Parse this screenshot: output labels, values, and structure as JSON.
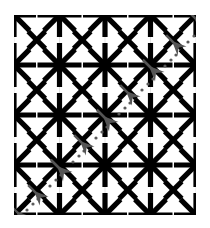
{
  "figure": {
    "type": "optical-illusion-pattern",
    "canvas": {
      "width": 210,
      "height": 228
    },
    "background_color": "#ffffff"
  },
  "lattice": {
    "description": "5 by 5 grid of 8-armed black asterisk nodes with black X marks at the centers of the cells between them",
    "node_rows": 5,
    "node_cols": 5,
    "origin_x": 14,
    "origin_y": 15,
    "step_x": 45.5,
    "step_y": 50.0,
    "node_arm_length": 22,
    "node_stroke_width": 5.2,
    "node_color": "#000000",
    "cross_arm_length": 12,
    "cross_stroke_width": 5.2,
    "cross_color": "#000000",
    "gridline_color": "#dcdcdc",
    "gridline_width": 0.8,
    "clip_box": {
      "x": 14,
      "y": 15,
      "width": 182,
      "height": 200
    }
  },
  "arrow_chain": {
    "description": "Chain of gray arrowheads with dotted trails running along the anti-diagonal from the top-right corner to the bottom-left corner",
    "color": "#555555",
    "dot_color": "#5a5a5a",
    "direction_degrees": 225,
    "arrowhead_size": 15,
    "start": {
      "x": 197,
      "y": 14
    },
    "end": {
      "x": 16,
      "y": 212
    },
    "arrowheads": [
      {
        "x": 194,
        "y": 17,
        "size": 16
      },
      {
        "x": 172,
        "y": 41,
        "size": 15
      },
      {
        "x": 149,
        "y": 66,
        "size": 16
      },
      {
        "x": 126,
        "y": 91,
        "size": 15
      },
      {
        "x": 103,
        "y": 116,
        "size": 16
      },
      {
        "x": 80,
        "y": 141,
        "size": 15
      },
      {
        "x": 57,
        "y": 166,
        "size": 16
      },
      {
        "x": 34,
        "y": 191,
        "size": 15
      },
      {
        "x": 16,
        "y": 211,
        "size": 14
      }
    ],
    "dot_trail": {
      "dot_radius": 1.6,
      "offset_perpendicular": 11,
      "dots": [
        {
          "x": 199,
          "y": 31
        },
        {
          "x": 194,
          "y": 36
        },
        {
          "x": 188,
          "y": 42
        },
        {
          "x": 176,
          "y": 55
        },
        {
          "x": 171,
          "y": 60
        },
        {
          "x": 165,
          "y": 66
        },
        {
          "x": 153,
          "y": 79
        },
        {
          "x": 148,
          "y": 84
        },
        {
          "x": 142,
          "y": 90
        },
        {
          "x": 130,
          "y": 103
        },
        {
          "x": 125,
          "y": 108
        },
        {
          "x": 119,
          "y": 114
        },
        {
          "x": 107,
          "y": 127
        },
        {
          "x": 102,
          "y": 132
        },
        {
          "x": 96,
          "y": 138
        },
        {
          "x": 84,
          "y": 151
        },
        {
          "x": 79,
          "y": 156
        },
        {
          "x": 73,
          "y": 162
        },
        {
          "x": 61,
          "y": 175
        },
        {
          "x": 56,
          "y": 180
        },
        {
          "x": 50,
          "y": 186
        },
        {
          "x": 38,
          "y": 199
        },
        {
          "x": 33,
          "y": 204
        },
        {
          "x": 27,
          "y": 210
        }
      ]
    }
  }
}
